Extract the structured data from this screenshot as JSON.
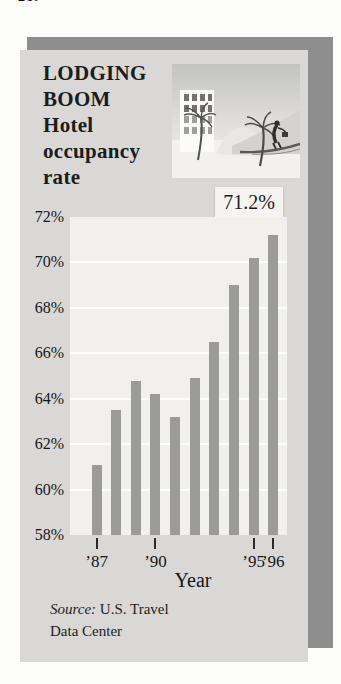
{
  "page": {
    "exercise_number": "10."
  },
  "card": {
    "title_lines": [
      "LODGING",
      "BOOM",
      "Hotel",
      "occupancy",
      "rate"
    ],
    "source": {
      "prefix_italic": "Source:",
      "line1_rest": " U.S. Travel",
      "line2": "Data Center"
    }
  },
  "illustration": {
    "description": "beach hotel scene with building, palm trees, dune and bellhop walking on a road"
  },
  "chart_data": {
    "type": "bar",
    "categories": [
      "’87",
      "’88",
      "’89",
      "’90",
      "’91",
      "’92",
      "’93",
      "’94",
      "’95",
      "’96"
    ],
    "values": [
      61.1,
      63.5,
      64.8,
      64.2,
      63.2,
      64.9,
      66.5,
      69.0,
      70.2,
      71.2
    ],
    "xlabel": "Year",
    "ylabel": "",
    "ylim": [
      58,
      72
    ],
    "y_tick_step": 2,
    "y_ticks": [
      {
        "value": 72,
        "label": "72%"
      },
      {
        "value": 70,
        "label": "70%"
      },
      {
        "value": 68,
        "label": "68%"
      },
      {
        "value": 66,
        "label": "66%"
      },
      {
        "value": 64,
        "label": "64%"
      },
      {
        "value": 62,
        "label": "62%"
      },
      {
        "value": 60,
        "label": "60%"
      },
      {
        "value": 58,
        "label": "58%"
      }
    ],
    "x_ticks": [
      {
        "index": 0,
        "label": "’87"
      },
      {
        "index": 3,
        "label": "’90"
      },
      {
        "index": 8,
        "label": "’95"
      },
      {
        "index": 9,
        "label": "’96"
      }
    ],
    "annotation": {
      "bar_index": 9,
      "label": "71.2%"
    },
    "grid": "horizontal-white-lines",
    "legend": "none",
    "bar_color": "#9b9b9a",
    "plot_bg": "#f1f0ec"
  },
  "colors": {
    "page_bg": "#fcfcfa",
    "card_bg": "#d9d8d6",
    "shadow": "#8e8e8e",
    "callout_bg": "#f5f4f1",
    "text": "#1c1c1c"
  }
}
